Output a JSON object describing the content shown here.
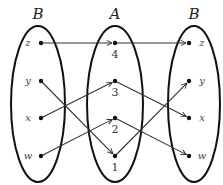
{
  "diagram": {
    "type": "function-composition-mapping",
    "sets": [
      {
        "id": "left",
        "label": "B",
        "cx": 38,
        "cy": 104,
        "rx": 27,
        "ry": 78,
        "elements": [
          {
            "label": "z",
            "x": 41,
            "y": 43
          },
          {
            "label": "y",
            "x": 41,
            "y": 81
          },
          {
            "label": "x",
            "x": 41,
            "y": 118
          },
          {
            "label": "w",
            "x": 41,
            "y": 156
          }
        ]
      },
      {
        "id": "middle",
        "label": "A",
        "cx": 115,
        "cy": 104,
        "rx": 28,
        "ry": 78,
        "elements": [
          {
            "label": "4",
            "x": 115,
            "y": 43
          },
          {
            "label": "3",
            "x": 115,
            "y": 81
          },
          {
            "label": "2",
            "x": 115,
            "y": 118
          },
          {
            "label": "1",
            "x": 115,
            "y": 156
          }
        ]
      },
      {
        "id": "right",
        "label": "B",
        "cx": 194,
        "cy": 104,
        "rx": 26,
        "ry": 78,
        "elements": [
          {
            "label": "z",
            "x": 189,
            "y": 43
          },
          {
            "label": "y",
            "x": 189,
            "y": 81
          },
          {
            "label": "x",
            "x": 189,
            "y": 118
          },
          {
            "label": "w",
            "x": 189,
            "y": 156
          }
        ]
      }
    ],
    "mappings_left_to_middle": [
      {
        "from": "z",
        "to": "4"
      },
      {
        "from": "y",
        "to": "1"
      },
      {
        "from": "x",
        "to": "3"
      },
      {
        "from": "w",
        "to": "2"
      }
    ],
    "mappings_middle_to_right": [
      {
        "from": "4",
        "to": "z"
      },
      {
        "from": "3",
        "to": "x"
      },
      {
        "from": "2",
        "to": "w"
      },
      {
        "from": "1",
        "to": "y"
      }
    ],
    "colors": {
      "stroke": "#111111",
      "arrow": "#333333",
      "background": "#ffffff"
    }
  }
}
